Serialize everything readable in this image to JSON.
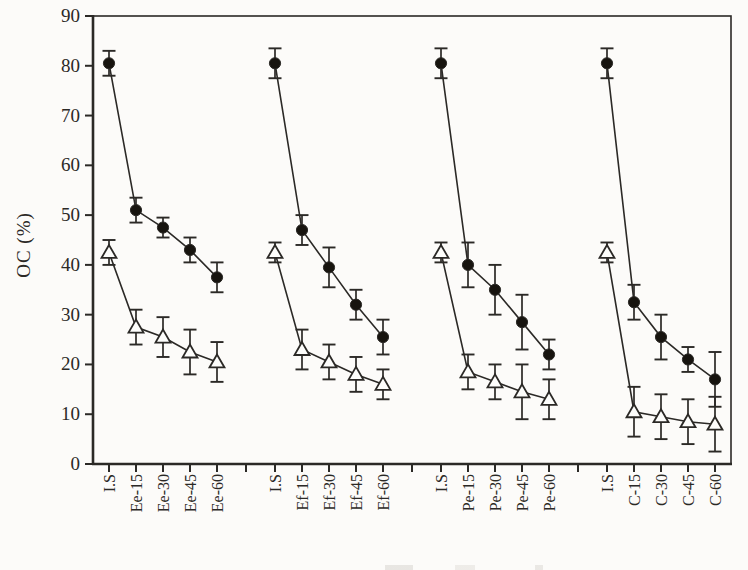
{
  "figure": {
    "background": "#fcfbf9",
    "ink_color": "#2b2926",
    "marker_fill_circle": "#17140f",
    "marker_fill_triangle": "#fdfdfb"
  },
  "chart_data": {
    "type": "scatter",
    "title": "",
    "xlabel": "",
    "ylabel": "OC (%)",
    "ylim": [
      0,
      90
    ],
    "yticks": [
      0,
      10,
      20,
      30,
      40,
      50,
      60,
      70,
      80,
      90
    ],
    "grid": false,
    "legend_position": "none",
    "groups": [
      {
        "name": "Ee",
        "categories": [
          "I.S",
          "Ee-15",
          "Ee-30",
          "Ee-45",
          "Ee-60"
        ]
      },
      {
        "name": "Ef",
        "categories": [
          "I.S",
          "Ef-15",
          "Ef-30",
          "Ef-45",
          "Ef-60"
        ]
      },
      {
        "name": "Pe",
        "categories": [
          "I.S",
          "Pe-15",
          "Pe-30",
          "Pe-45",
          "Pe-60"
        ]
      },
      {
        "name": "C",
        "categories": [
          "I.S",
          "C-15",
          "C-30",
          "C-45",
          "C-60"
        ]
      }
    ],
    "series": [
      {
        "name": "filled-circle-series",
        "marker": "circle",
        "values_by_group": [
          [
            80.5,
            51,
            47.5,
            43,
            37.5
          ],
          [
            80.5,
            47,
            39.5,
            32,
            25.5
          ],
          [
            80.5,
            40,
            35,
            28.5,
            22
          ],
          [
            80.5,
            32.5,
            25.5,
            21,
            17
          ]
        ],
        "errors_by_group": [
          [
            2.5,
            2.5,
            2,
            2.5,
            3
          ],
          [
            3,
            3,
            4,
            3,
            3.5
          ],
          [
            3,
            4.5,
            5,
            5.5,
            3
          ],
          [
            3,
            3.5,
            4.5,
            2.5,
            5.5
          ]
        ]
      },
      {
        "name": "open-triangle-series",
        "marker": "triangle",
        "values_by_group": [
          [
            42.5,
            27.5,
            25.5,
            22.5,
            20.5
          ],
          [
            42.5,
            23,
            20.5,
            18,
            16
          ],
          [
            42.5,
            18.5,
            16.5,
            14.5,
            13
          ],
          [
            42.5,
            10.5,
            9.5,
            8.5,
            8
          ]
        ],
        "errors_by_group": [
          [
            2.5,
            3.5,
            4,
            4.5,
            4
          ],
          [
            2,
            4,
            3.5,
            3.5,
            3
          ],
          [
            2,
            3.5,
            3.5,
            5.5,
            4
          ],
          [
            2,
            5,
            4.5,
            4.5,
            5.5
          ]
        ]
      }
    ]
  }
}
